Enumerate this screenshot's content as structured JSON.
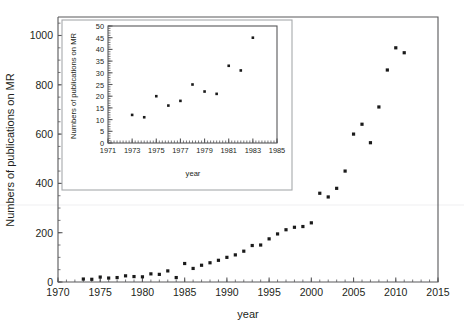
{
  "figure": {
    "background": "#ffffff",
    "point_color": "#1a1a1a",
    "axis_color": "#58585a"
  },
  "main": {
    "xlabel": "year",
    "ylabel": "Numbers of publications on MR",
    "xticks": [
      "1970",
      "1975",
      "1980",
      "1985",
      "1990",
      "1995",
      "2000",
      "2005",
      "2010",
      "2015"
    ],
    "yticks": [
      "0",
      "200",
      "400",
      "600",
      "800",
      "1000"
    ]
  },
  "inset": {
    "xlabel": "year",
    "ylabel": "Numbers of publications on MR",
    "xticks": [
      "1971",
      "1973",
      "1975",
      "1977",
      "1979",
      "1981",
      "1983",
      "1985"
    ],
    "yticks": [
      "0",
      "5",
      "10",
      "15",
      "20",
      "25",
      "30",
      "35",
      "40",
      "45",
      "50"
    ]
  },
  "chart_data": [
    {
      "type": "scatter",
      "name": "main-plot",
      "title": "",
      "xlabel": "year",
      "ylabel": "Numbers of publications on MR",
      "xlim": [
        1970,
        2015
      ],
      "ylim": [
        0,
        1075
      ],
      "xticks": [
        1970,
        1975,
        1980,
        1985,
        1990,
        1995,
        2000,
        2005,
        2010,
        2015
      ],
      "yticks": [
        0,
        200,
        400,
        600,
        800,
        1000
      ],
      "xminor_step": 1,
      "yminor_step": 50,
      "grid": false,
      "legend": null,
      "marker": "filled-square",
      "x": [
        1973,
        1974,
        1975,
        1976,
        1977,
        1978,
        1979,
        1980,
        1981,
        1982,
        1983,
        1984,
        1985,
        1986,
        1987,
        1988,
        1989,
        1990,
        1991,
        1992,
        1993,
        1994,
        1995,
        1996,
        1997,
        1998,
        1999,
        2000,
        2001,
        2002,
        2003,
        2004,
        2005,
        2006,
        2007,
        2008,
        2009,
        2010,
        2011
      ],
      "y": [
        12,
        11,
        20,
        16,
        18,
        25,
        22,
        21,
        33,
        31,
        45,
        18,
        75,
        55,
        68,
        78,
        88,
        100,
        110,
        125,
        148,
        150,
        175,
        195,
        212,
        222,
        225,
        240,
        360,
        345,
        380,
        450,
        600,
        640,
        565,
        710,
        860,
        950,
        930
      ],
      "notes": "Counts rise slowly through the 1970s-80s then accelerate steeply after 2000, peaking near 950 around 2010."
    },
    {
      "type": "scatter",
      "name": "inset-plot",
      "title": "",
      "xlabel": "year",
      "ylabel": "Numbers of publications on MR",
      "xlim": [
        1971,
        1985
      ],
      "ylim": [
        0,
        50
      ],
      "xticks": [
        1971,
        1973,
        1975,
        1977,
        1979,
        1981,
        1983,
        1985
      ],
      "yticks": [
        0,
        5,
        10,
        15,
        20,
        25,
        30,
        35,
        40,
        45,
        50
      ],
      "xminor_step": 0.25,
      "yminor_step": 1,
      "grid": false,
      "legend": null,
      "marker": "filled-square",
      "x": [
        1973,
        1974,
        1975,
        1976,
        1977,
        1978,
        1979,
        1980,
        1981,
        1982,
        1983
      ],
      "y": [
        12,
        11,
        20,
        16,
        18,
        25,
        22,
        21,
        33,
        31,
        45
      ],
      "notes": "Magnified view of the earliest years of the main series, 1971-1985."
    }
  ]
}
